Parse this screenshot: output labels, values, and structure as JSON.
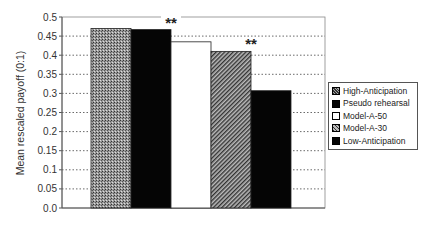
{
  "chart_data": {
    "type": "bar",
    "title": "",
    "xlabel": "",
    "ylabel": "Mean rescaled payoff (0:1)",
    "ylim": [
      0.0,
      0.5
    ],
    "yticks": [
      "0.0",
      "0.05",
      "0.1",
      "0.15",
      "0.2",
      "0.25",
      "0.3",
      "0.35",
      "0.4",
      "0.45",
      "0.5"
    ],
    "grid": "horizontal dotted",
    "legend_position": "right",
    "categories": [
      "High-Anticipation",
      "Pseudo rehearsal",
      "Model-A-50",
      "Model-A-30",
      "Low-Anticipation"
    ],
    "values": [
      0.47,
      0.467,
      0.435,
      0.41,
      0.307
    ],
    "annotations": [
      {
        "text": "**",
        "between": [
          "Pseudo rehearsal",
          "Model-A-50"
        ]
      },
      {
        "text": "**",
        "between": [
          "Model-A-30",
          "Low-Anticipation"
        ]
      }
    ],
    "series_styles": [
      {
        "name": "High-Anticipation",
        "pattern": "crosshatch-grey"
      },
      {
        "name": "Pseudo rehearsal",
        "pattern": "solid-black"
      },
      {
        "name": "Model-A-50",
        "pattern": "white"
      },
      {
        "name": "Model-A-30",
        "pattern": "diagonal-grey"
      },
      {
        "name": "Low-Anticipation",
        "pattern": "solid-black"
      }
    ]
  },
  "legend": {
    "items": [
      "High-Anticipation",
      "Pseudo rehearsal",
      "Model-A-50",
      "Model-A-30",
      "Low-Anticipation"
    ]
  },
  "axis": {
    "ylabel": "Mean rescaled payoff (0:1)"
  }
}
